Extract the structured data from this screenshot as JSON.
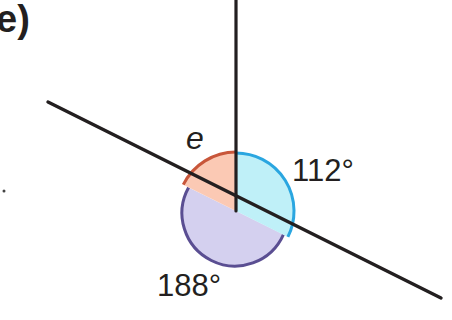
{
  "diagram": {
    "part_label": "e)",
    "type": "angles around a point",
    "vertex": {
      "x": 236,
      "y": 211
    },
    "lines": [
      {
        "name": "vertical-ray",
        "from": {
          "x": 236,
          "y": 0
        },
        "to": {
          "x": 236,
          "y": 211
        }
      },
      {
        "name": "straight-line",
        "from": {
          "x": 48,
          "y": 102
        },
        "to": {
          "x": 441,
          "y": 298
        }
      }
    ],
    "angles": [
      {
        "id": "e",
        "label": "e",
        "value": null,
        "unknown": true,
        "fill": "#fbc9b4",
        "stroke": "#c8563a"
      },
      {
        "id": "a112",
        "label": "112°",
        "value": 112,
        "unknown": false,
        "fill": "#bff0f8",
        "stroke": "#2aa6e0"
      },
      {
        "id": "a188",
        "label": "188°",
        "value": 188,
        "unknown": false,
        "fill": "#d4d0ef",
        "stroke": "#5a4e92"
      }
    ],
    "colors": {
      "line": "#231f20",
      "text": "#231f20",
      "background": "#ffffff"
    }
  }
}
